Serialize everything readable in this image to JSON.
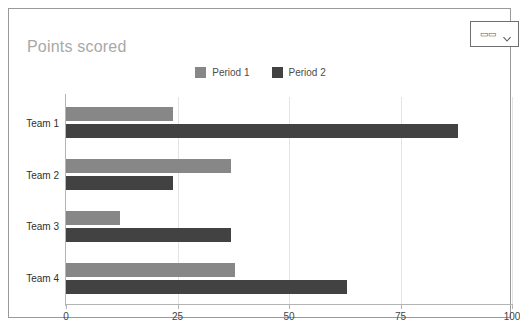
{
  "window": {
    "type_button": {
      "icon": "bar-chart-icon",
      "glyph": "▭▭",
      "chevron": "chevron-down-icon"
    }
  },
  "chart_data": {
    "type": "bar",
    "orientation": "horizontal",
    "title": "Points scored",
    "xlabel": "",
    "ylabel": "",
    "categories": [
      "Team 1",
      "Team 2",
      "Team 3",
      "Team 4"
    ],
    "series": [
      {
        "name": "Period 1",
        "color": "#878787",
        "values": [
          24,
          37,
          12,
          38
        ]
      },
      {
        "name": "Period 2",
        "color": "#424242",
        "values": [
          88,
          24,
          37,
          63
        ]
      }
    ],
    "xlim": [
      0,
      100
    ],
    "xticks": [
      0,
      25,
      50,
      75,
      100
    ],
    "xtick_labels": [
      "0",
      "25",
      "50",
      "75",
      "100"
    ],
    "grid": true,
    "legend_position": "top-center"
  }
}
